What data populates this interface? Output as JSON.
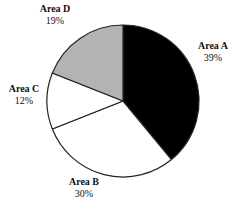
{
  "chart_data": {
    "type": "pie",
    "title": "",
    "start_angle_deg": 0,
    "direction": "clockwise",
    "center": [
      123,
      101
    ],
    "radius": 76,
    "slices": [
      {
        "name": "Area A",
        "value": 39,
        "label": "39%",
        "color": "#000000",
        "label_pos": [
          213,
          40
        ]
      },
      {
        "name": "Area B",
        "value": 30,
        "label": "30%",
        "color": "#ffffff",
        "label_pos": [
          84,
          176
        ]
      },
      {
        "name": "Area C",
        "value": 12,
        "label": "12%",
        "color": "#ffffff",
        "label_pos": [
          24,
          83
        ]
      },
      {
        "name": "Area D",
        "value": 19,
        "label": "19%",
        "color": "#b3b3b3",
        "label_pos": [
          55,
          3
        ]
      }
    ],
    "stroke_color": "#222222",
    "legend": "none"
  }
}
